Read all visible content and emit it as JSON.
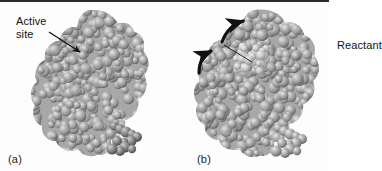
{
  "figure": {
    "kind": "scientific-illustration",
    "background_color": "#fdfdfd",
    "rule_color": "#2a2a2a",
    "ink_color": "#121212"
  },
  "panels": [
    {
      "id": "a",
      "caption": "(a)",
      "molecule": {
        "name": "enzyme-space-filling-model",
        "atom_color_light": "#d6d6d6",
        "atom_color_mid": "#9a9a9a",
        "atom_color_dark": "#5e5e5e"
      },
      "annotations": [
        {
          "name": "active-site-label",
          "text": "Active\nsite",
          "pointer": "straight-arrow",
          "pointer_direction": "down-right"
        }
      ]
    },
    {
      "id": "b",
      "caption": "(b)",
      "molecule": {
        "name": "enzyme-substrate-complex-space-filling-model",
        "atom_color_light": "#d6d6d6",
        "atom_color_mid": "#9a9a9a",
        "atom_color_dark": "#5e5e5e"
      },
      "annotations": [
        {
          "name": "reactant-label",
          "text": "Reactant",
          "pointer": "leader-line",
          "pointer_direction": "down-right"
        },
        {
          "name": "motion-arrow-upper",
          "text": "",
          "pointer": "curved-arrow",
          "pointer_direction": "up-right"
        },
        {
          "name": "motion-arrow-lower",
          "text": "",
          "pointer": "curved-arrow",
          "pointer_direction": "up-right"
        }
      ]
    }
  ]
}
